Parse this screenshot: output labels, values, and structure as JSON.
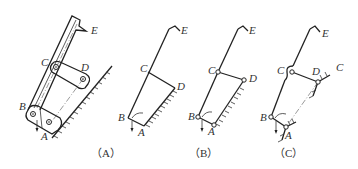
{
  "figure": {
    "panels": [
      {
        "id": "A",
        "caption": "（A）",
        "labels": {
          "A": "A",
          "B": "B",
          "C": "C",
          "D": "D",
          "E": "E"
        }
      },
      {
        "id": "B",
        "caption": "（B）",
        "labels": {
          "A": "A",
          "B": "B",
          "C": "C",
          "D": "D",
          "E": "E"
        }
      },
      {
        "id": "C",
        "caption": "（C）",
        "labels": {
          "A": "A",
          "B": "B",
          "C": "C",
          "D": "D",
          "E": "E",
          "C2": "C"
        }
      }
    ]
  }
}
